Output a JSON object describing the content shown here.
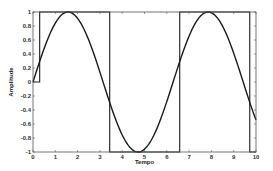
{
  "chart_data": {
    "type": "line",
    "title": "",
    "xlabel": "Tempo",
    "ylabel": "Amplitude",
    "xlim": [
      0,
      10
    ],
    "ylim": [
      -1,
      1
    ],
    "x_ticks": [
      0,
      1,
      2,
      3,
      4,
      5,
      6,
      7,
      8,
      9,
      10
    ],
    "y_ticks": [
      -1,
      -0.8,
      -0.6,
      -0.4,
      -0.2,
      0,
      0.2,
      0.4,
      0.6,
      0.8,
      1
    ],
    "y_tick_labels": [
      "-1",
      "-0.8",
      "-0.6",
      "-0.4",
      "-0.2",
      "0",
      "0.2",
      "0.4",
      "0.6",
      "0.8",
      "1"
    ],
    "grid": false,
    "legend": null,
    "series": [
      {
        "name": "sine",
        "description": "sin(t)",
        "color": "#1a1a1a",
        "x": [
          0,
          0.5,
          1,
          1.5708,
          2,
          2.5,
          3,
          3.5,
          4,
          4.7124,
          5,
          5.5,
          6,
          6.5,
          7,
          7.854,
          8,
          8.5,
          9,
          9.5,
          10
        ],
        "y": [
          0,
          0.479,
          0.841,
          1.0,
          0.909,
          0.598,
          0.141,
          -0.351,
          -0.757,
          -1.0,
          -0.959,
          -0.706,
          -0.279,
          0.215,
          0.657,
          1.0,
          0.989,
          0.798,
          0.412,
          -0.075,
          -0.544
        ]
      },
      {
        "name": "square",
        "description": "sign(sin(t - 0.3)), 0 for t < 0.3",
        "color": "#1a1a1a",
        "x": [
          0,
          0.3,
          0.3,
          3.44,
          3.44,
          6.58,
          6.58,
          9.72,
          9.72,
          10
        ],
        "y": [
          0,
          0,
          1,
          1,
          -1,
          -1,
          1,
          1,
          -1,
          -1
        ]
      }
    ]
  },
  "plot_area": {
    "left": 33,
    "top": 12,
    "right": 256,
    "bottom": 152
  }
}
